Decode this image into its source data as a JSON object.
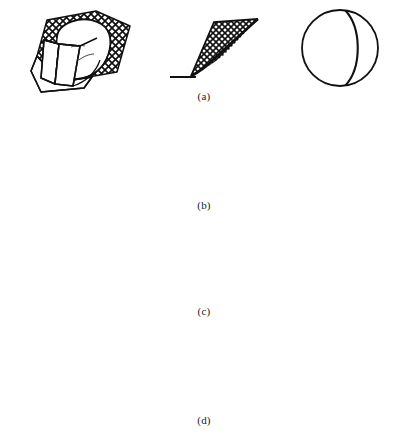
{
  "figure": {
    "background_color": "#ffffff",
    "line_color": "#111111",
    "columns": [
      {
        "name": "block-diagram",
        "label": "3D block diagram"
      },
      {
        "name": "cross-section",
        "label": "Cross section"
      },
      {
        "name": "stereonet",
        "label": "Stereographic projection"
      }
    ],
    "rows": [
      {
        "id": "a",
        "caption": "(a)",
        "failure_mode": "circular failure",
        "block": {
          "name": "circular-failure-block",
          "hatch": "cross-hatch",
          "has_arrow": false
        },
        "section": {
          "name": "circular-failure-section",
          "hatch": "cross-hatch",
          "slip_surface": "curved"
        },
        "stereonet": {
          "name": "stereonet-circular",
          "solid_arcs": 1,
          "dashed_arcs": 0,
          "poles": 0,
          "labels": []
        }
      },
      {
        "id": "b",
        "caption": "(b)",
        "failure_mode": "plane failure",
        "block": {
          "name": "plane-failure-block",
          "hatch": "brick-hatch",
          "has_arrow": true
        },
        "section": {
          "name": "plane-failure-section",
          "hatch": "brick-hatch",
          "slip_surface": "planar"
        },
        "stereonet": {
          "name": "stereonet-plane",
          "solid_arcs": 1,
          "dashed_arcs": 1,
          "poles": 1,
          "labels": []
        }
      },
      {
        "id": "c",
        "caption": "(c)",
        "failure_mode": "wedge failure",
        "block": {
          "name": "wedge-failure-block",
          "hatch": "none",
          "has_arrow": true
        },
        "section": {
          "name": "wedge-failure-section",
          "hatch": "none",
          "slip_surface": "wedge-intersection"
        },
        "stereonet": {
          "name": "stereonet-wedge",
          "solid_arcs": 2,
          "dashed_arcs": 2,
          "poles": 2,
          "labels": [
            {
              "text": "1",
              "position": "top-right"
            },
            {
              "text": "2",
              "position": "left"
            },
            {
              "text": "1",
              "position": "bottom-left"
            },
            {
              "text": "2",
              "position": "bottom-right"
            },
            {
              "text": "M",
              "position": "inner-right"
            },
            {
              "text": "O",
              "position": "center"
            }
          ]
        }
      },
      {
        "id": "d",
        "caption": "(d)",
        "failure_mode": "toppling failure",
        "block": {
          "name": "toppling-failure-block",
          "hatch": "slab-bands",
          "has_arrow": false
        },
        "section": {
          "name": "toppling-failure-section",
          "hatch": "columnar-blocks",
          "slip_surface": "stepped"
        },
        "stereonet": {
          "name": "stereonet-toppling",
          "solid_arcs": 1,
          "dashed_arcs": 2,
          "poles": 2,
          "labels": []
        }
      }
    ]
  },
  "labels": {
    "wedge_1a": "1",
    "wedge_2a": "2",
    "wedge_1b": "1",
    "wedge_2b": "2",
    "wedge_M": "M",
    "wedge_O": "O"
  }
}
